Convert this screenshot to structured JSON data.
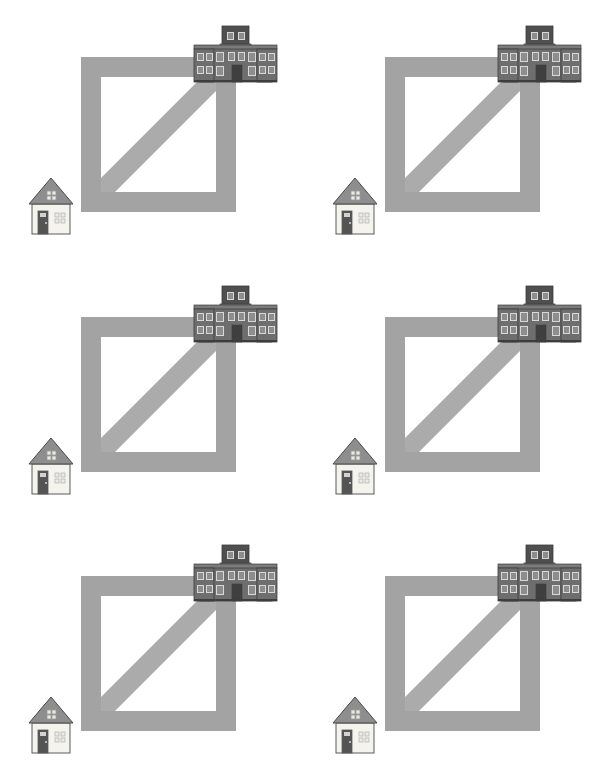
{
  "canvas": {
    "width": 608,
    "height": 779,
    "background_color": "#ffffff",
    "title": "Repeated scene grid: square path with diagonal, house and school building"
  },
  "grid": {
    "columns": 2,
    "rows": 3,
    "cell_width": 304,
    "cell_height": 260,
    "total_cells": 6,
    "cells": [
      {
        "id": "cell-1",
        "row": 1,
        "column": 1,
        "x": 0,
        "y": 0
      },
      {
        "id": "cell-2",
        "row": 1,
        "column": 2,
        "x": 304,
        "y": 0
      },
      {
        "id": "cell-3",
        "row": 2,
        "column": 1,
        "x": 0,
        "y": 260
      },
      {
        "id": "cell-4",
        "row": 2,
        "column": 2,
        "x": 304,
        "y": 260
      },
      {
        "id": "cell-5",
        "row": 3,
        "column": 1,
        "x": 0,
        "y": 519
      },
      {
        "id": "cell-6",
        "row": 3,
        "column": 2,
        "x": 304,
        "y": 519
      }
    ]
  },
  "colors": {
    "path_gray": "#a3a3a3",
    "path_gray_light": "#ababab",
    "building_body": "#6e6e6e",
    "building_tower": "#4f4f4f",
    "building_roof": "#7b7b7b",
    "building_outline": "#3d3d3d",
    "building_window_frame": "#d8d8d8",
    "building_window_glass": "#8d8d8d",
    "building_door": "#3f3f3f",
    "house_roof": "#8e8e8e",
    "house_roof_outline": "#4a4a4a",
    "house_wall": "#f4f3ee",
    "house_wall_outline": "#5a5a5a",
    "house_door": "#545454",
    "house_window": "#e9e9e4",
    "house_window_frame": "#9a9a9a",
    "background": "#ffffff"
  },
  "scene": {
    "name": "square-path-scene",
    "description": "A thick gray square outline with a diagonal band running from the inner bottom-left corner to the inner top-right corner. A small residential house sits at the lower-left outside the square; a large multi-storey school building sits over the top-right corner of the square.",
    "square_path": {
      "name": "square-path",
      "outer_x": 81,
      "outer_y": 57,
      "outer_size": 155,
      "stroke_width": 20,
      "fill": "#a3a3a3"
    },
    "diagonal": {
      "name": "diagonal-band",
      "from": "inner-bottom-left",
      "to": "inner-top-right",
      "band_width": 20,
      "fill": "#ababab"
    },
    "house": {
      "name": "small-house",
      "x": 29,
      "y": 178,
      "width": 44,
      "height": 56,
      "stories": 1,
      "roof_shape": "gable",
      "attic_window_panes": 4,
      "door_count": 1,
      "side_window_panes": 4
    },
    "building": {
      "name": "school-building",
      "x": 194,
      "y": 26,
      "width": 83,
      "height": 56,
      "stories": 2,
      "tower_stories": 1,
      "wing_count": 2,
      "window_columns_per_wing": 2,
      "window_rows": 2,
      "central_window_columns": 2,
      "door_count": 1
    }
  },
  "labels": {
    "house_label": "house",
    "building_label": "school building",
    "path_label": "square path with diagonal",
    "scene_label": "scene"
  }
}
